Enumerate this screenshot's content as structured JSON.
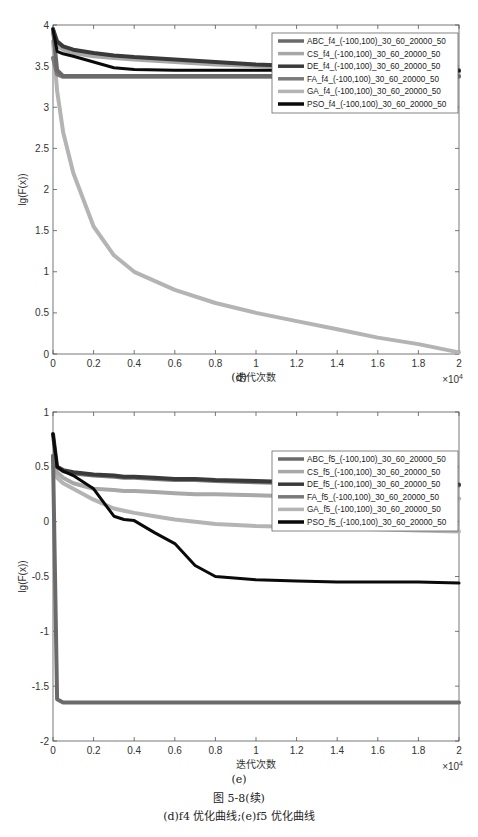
{
  "figure": {
    "caption_title": "图 5-8(续)",
    "caption_sub": "(d)f4 优化曲线;(e)f5 优化曲线"
  },
  "chart_data": [
    {
      "type": "line",
      "panel_label": "(d)",
      "title": "",
      "xlabel": "迭代次数",
      "ylabel": "lg(F(x))",
      "x_multiplier": "×10^4",
      "xlim": [
        0,
        2
      ],
      "ylim": [
        0,
        4
      ],
      "xticks": [
        "0",
        "0.2",
        "0.4",
        "0.6",
        "0.8",
        "1",
        "1.2",
        "1.4",
        "1.6",
        "1.8",
        "2"
      ],
      "yticks": [
        "0",
        "0.5",
        "1",
        "1.5",
        "2",
        "2.5",
        "3",
        "3.5",
        "4"
      ],
      "legend_position": "upper right",
      "grid": false,
      "x": [
        0,
        0.02,
        0.05,
        0.1,
        0.2,
        0.3,
        0.4,
        0.6,
        0.8,
        1.0,
        1.2,
        1.4,
        1.6,
        1.8,
        2.0
      ],
      "series": [
        {
          "name": "ABC_f4_(-100,100)_30_60_20000_50",
          "color": "#6a6a6a",
          "values": [
            3.95,
            3.45,
            3.38,
            3.38,
            3.38,
            3.38,
            3.38,
            3.38,
            3.38,
            3.38,
            3.38,
            3.38,
            3.38,
            3.38,
            3.38
          ]
        },
        {
          "name": "CS_f4_(-100,100)_30_60_20000_50",
          "color": "#a8a8a8",
          "values": [
            3.9,
            3.75,
            3.7,
            3.66,
            3.62,
            3.6,
            3.58,
            3.55,
            3.52,
            3.5,
            3.48,
            3.46,
            3.45,
            3.44,
            3.43
          ]
        },
        {
          "name": "DE_f4_(-100,100)_30_60_20000_50",
          "color": "#3a3a3a",
          "values": [
            3.95,
            3.8,
            3.74,
            3.7,
            3.66,
            3.63,
            3.61,
            3.58,
            3.55,
            3.52,
            3.5,
            3.48,
            3.47,
            3.46,
            3.45
          ]
        },
        {
          "name": "FA_f4_(-100,100)_30_60_20000_50",
          "color": "#7a7a7a",
          "values": [
            3.6,
            3.4,
            3.37,
            3.37,
            3.37,
            3.37,
            3.37,
            3.37,
            3.37,
            3.37,
            3.37,
            3.37,
            3.37,
            3.37,
            3.37
          ]
        },
        {
          "name": "GA_f4_(-100,100)_30_60_20000_50",
          "color": "#b4b4b4",
          "values": [
            3.8,
            3.2,
            2.7,
            2.2,
            1.55,
            1.2,
            1.0,
            0.78,
            0.62,
            0.5,
            0.4,
            0.3,
            0.2,
            0.12,
            0.02
          ]
        },
        {
          "name": "PSO_f4_(-100,100)_30_60_20000_50",
          "color": "#0a0a0a",
          "values": [
            3.95,
            3.68,
            3.65,
            3.62,
            3.55,
            3.48,
            3.46,
            3.45,
            3.45,
            3.45,
            3.45,
            3.44,
            3.44,
            3.44,
            3.44
          ]
        }
      ]
    },
    {
      "type": "line",
      "panel_label": "(e)",
      "title": "",
      "xlabel": "迭代次数",
      "ylabel": "lg(F(x))",
      "x_multiplier": "×10^4",
      "xlim": [
        0,
        2
      ],
      "ylim": [
        -2,
        1
      ],
      "xticks": [
        "0",
        "0.2",
        "0.4",
        "0.6",
        "0.8",
        "1",
        "1.2",
        "1.4",
        "1.6",
        "1.8",
        "2"
      ],
      "yticks": [
        "-2",
        "-1.5",
        "-1",
        "-0.5",
        "0",
        "0.5",
        "1"
      ],
      "legend_position": "upper right",
      "grid": false,
      "x": [
        0,
        0.02,
        0.05,
        0.1,
        0.2,
        0.3,
        0.35,
        0.4,
        0.5,
        0.6,
        0.7,
        0.8,
        1.0,
        1.2,
        1.4,
        1.6,
        1.8,
        2.0
      ],
      "series": [
        {
          "name": "ABC_f5_(-100,100)_30_60_20000_50",
          "color": "#6a6a6a",
          "values": [
            0.6,
            -1.62,
            -1.65,
            -1.65,
            -1.65,
            -1.65,
            -1.65,
            -1.65,
            -1.65,
            -1.65,
            -1.65,
            -1.65,
            -1.65,
            -1.65,
            -1.65,
            -1.65,
            -1.65,
            -1.65
          ]
        },
        {
          "name": "CS_f5_(-100,100)_30_60_20000_50",
          "color": "#a8a8a8",
          "values": [
            0.55,
            0.45,
            0.4,
            0.35,
            0.3,
            0.29,
            0.28,
            0.28,
            0.27,
            0.26,
            0.25,
            0.25,
            0.24,
            0.23,
            0.23,
            0.22,
            0.22,
            0.21
          ]
        },
        {
          "name": "DE_f5_(-100,100)_30_60_20000_50",
          "color": "#3a3a3a",
          "values": [
            0.8,
            0.5,
            0.47,
            0.45,
            0.43,
            0.42,
            0.41,
            0.41,
            0.4,
            0.39,
            0.39,
            0.38,
            0.37,
            0.36,
            0.35,
            0.35,
            0.34,
            0.34
          ]
        },
        {
          "name": "FA_f5_(-100,100)_30_60_20000_50",
          "color": "#7a7a7a",
          "values": [
            0.6,
            0.5,
            0.46,
            0.44,
            0.42,
            0.41,
            0.4,
            0.4,
            0.39,
            0.38,
            0.38,
            0.37,
            0.36,
            0.35,
            0.35,
            0.34,
            0.34,
            0.33
          ]
        },
        {
          "name": "GA_f5_(-100,100)_30_60_20000_50",
          "color": "#b4b4b4",
          "values": [
            0.5,
            0.4,
            0.35,
            0.3,
            0.2,
            0.12,
            0.1,
            0.08,
            0.05,
            0.02,
            0.0,
            -0.02,
            -0.04,
            -0.05,
            -0.06,
            -0.07,
            -0.08,
            -0.09
          ]
        },
        {
          "name": "PSO_f5_(-100,100)_30_60_20000_50",
          "color": "#0a0a0a",
          "values": [
            0.8,
            0.5,
            0.46,
            0.42,
            0.3,
            0.05,
            0.02,
            0.01,
            -0.1,
            -0.2,
            -0.4,
            -0.5,
            -0.53,
            -0.54,
            -0.55,
            -0.55,
            -0.55,
            -0.56
          ]
        }
      ]
    }
  ]
}
